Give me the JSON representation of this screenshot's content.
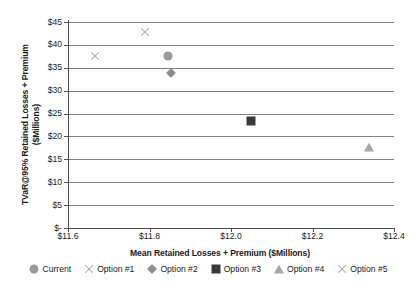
{
  "chart_data": {
    "type": "scatter",
    "title": "",
    "xlabel": "Mean Retained Losses + Premium ($Millions)",
    "ylabel_line1": "TVaR@95% Retained Losses + Premium",
    "ylabel_line2": "($Millions)",
    "xlim": [
      11.6,
      12.4
    ],
    "ylim": [
      0,
      45
    ],
    "grid": true,
    "legend_position": "bottom",
    "x_ticks": [
      "$11.6",
      "$11.8",
      "$12.0",
      "$12.2",
      "$12.4"
    ],
    "x_tick_values": [
      11.6,
      11.8,
      12.0,
      12.2,
      12.4
    ],
    "y_ticks": [
      "$-",
      "$5",
      "$10",
      "$15",
      "$20",
      "$25",
      "$30",
      "$35",
      "$40",
      "$45"
    ],
    "y_tick_values": [
      0,
      5,
      10,
      15,
      20,
      25,
      30,
      35,
      40,
      45
    ],
    "series": [
      {
        "name": "Current",
        "marker": "circle",
        "color": "#9a9a9a",
        "points": [
          {
            "x": 11.845,
            "y": 37.6
          }
        ]
      },
      {
        "name": "Option #1",
        "marker": "cross",
        "color": "#b0b0b0",
        "points": [
          {
            "x": 11.789,
            "y": 42.8
          }
        ]
      },
      {
        "name": "Option #2",
        "marker": "diamond",
        "color": "#8c8c8c",
        "points": [
          {
            "x": 11.853,
            "y": 33.8
          }
        ]
      },
      {
        "name": "Option #3",
        "marker": "square",
        "color": "#3a3a3a",
        "points": [
          {
            "x": 12.049,
            "y": 23.4
          }
        ]
      },
      {
        "name": "Option #4",
        "marker": "triangle",
        "color": "#a8a8a8",
        "points": [
          {
            "x": 12.338,
            "y": 17.7
          }
        ]
      },
      {
        "name": "Option #5",
        "marker": "cross",
        "color": "#b0b0b0",
        "points": [
          {
            "x": 11.667,
            "y": 37.6
          }
        ]
      }
    ]
  }
}
